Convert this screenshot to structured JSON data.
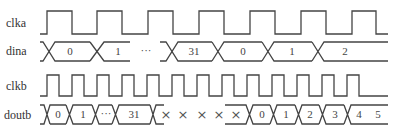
{
  "diagram": {
    "type": "timing-diagram",
    "signals": [
      {
        "name": "clka",
        "kind": "clock",
        "label_y": 27,
        "high_y": 11,
        "low_y": 34,
        "start_x": 40,
        "end_x": 388,
        "edges": [
          [
            47,
            72
          ],
          [
            97,
            122
          ],
          [
            148,
            173
          ],
          [
            199,
            224
          ],
          [
            250,
            275
          ],
          [
            301,
            326
          ],
          [
            352,
            376
          ]
        ]
      },
      {
        "name": "dina",
        "kind": "bus",
        "label_y": 55,
        "top_y": 42,
        "bot_y": 61,
        "segments": [
          {
            "from": 40,
            "to": 49,
            "value": ""
          },
          {
            "from": 49,
            "to": 97,
            "value": "0"
          },
          {
            "from": 97,
            "to": 130,
            "value": "1",
            "open_end": true
          },
          {
            "from": 148,
            "to": 160,
            "value": "···",
            "gap": true
          },
          {
            "from": 160,
            "to": 167,
            "value": "",
            "open_start": true
          },
          {
            "from": 167,
            "to": 217,
            "value": "31"
          },
          {
            "from": 217,
            "to": 266,
            "value": "0"
          },
          {
            "from": 266,
            "to": 318,
            "value": "1"
          },
          {
            "from": 318,
            "to": 388,
            "value": "2",
            "open_end_line": true
          }
        ],
        "ellipsis": {
          "x": 139,
          "text": "···"
        }
      },
      {
        "name": "clkb",
        "kind": "clock",
        "label_y": 90,
        "high_y": 75,
        "low_y": 96,
        "start_x": 40,
        "end_x": 388,
        "edges": [
          [
            47,
            59
          ],
          [
            72,
            84
          ],
          [
            97,
            109
          ],
          [
            122,
            134
          ],
          [
            147,
            159
          ],
          [
            172,
            184
          ],
          [
            197,
            209
          ],
          [
            222,
            234
          ],
          [
            247,
            259
          ],
          [
            272,
            284
          ],
          [
            297,
            309
          ],
          [
            322,
            334
          ],
          [
            347,
            359
          ]
        ]
      },
      {
        "name": "doutb",
        "kind": "bus",
        "label_y": 119,
        "top_y": 105,
        "bot_y": 124,
        "values": [
          "0",
          "1",
          "···",
          "31",
          "×",
          "×",
          "×",
          "×",
          "×",
          "0",
          "1",
          "2",
          "3",
          "4",
          "5"
        ],
        "crossings": [
          46,
          70,
          96,
          116,
          154,
          250,
          273,
          298,
          322,
          347
        ],
        "x_marks": [
          163,
          180,
          201,
          218,
          235
        ]
      }
    ],
    "labels": {
      "clka": "clka",
      "dina": "dina",
      "clkb": "clkb",
      "doutb": "doutb"
    },
    "bus_values": {
      "dina": [
        "0",
        "1",
        "···",
        "31",
        "0",
        "1",
        "2"
      ],
      "doutb": [
        "0",
        "1",
        "···",
        "31",
        "×",
        "×",
        "×",
        "×",
        "×",
        "0",
        "1",
        "2",
        "3",
        "4",
        "5"
      ]
    },
    "colors": {
      "line": "#444444",
      "text": "#333333",
      "background": "#ffffff"
    }
  }
}
